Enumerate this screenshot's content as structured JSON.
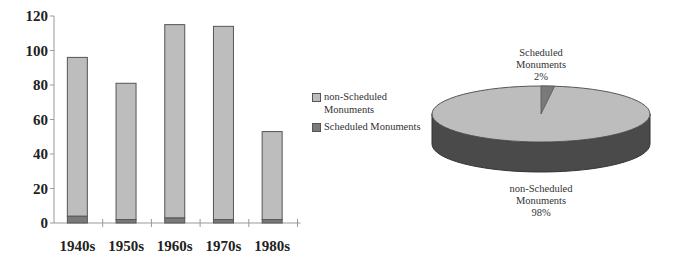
{
  "chart_data": [
    {
      "type": "bar",
      "stacked": true,
      "title": "",
      "xlabel": "",
      "ylabel": "",
      "categories": [
        "1940s",
        "1950s",
        "1960s",
        "1970s",
        "1980s"
      ],
      "series": [
        {
          "name": "Scheduled Monuments",
          "values": [
            4,
            2,
            3,
            2,
            2
          ],
          "color": "#7a7a7a"
        },
        {
          "name": "non-Scheduled Monuments",
          "values": [
            92,
            79,
            112,
            112,
            51
          ],
          "color": "#bdbdbd"
        }
      ],
      "totals": [
        96,
        81,
        115,
        114,
        53
      ],
      "ylim": [
        0,
        120
      ],
      "yticks": [
        0,
        20,
        40,
        60,
        80,
        100,
        120
      ],
      "grid": false,
      "legend_position": "right"
    },
    {
      "type": "pie",
      "style": "3d",
      "title": "",
      "slices": [
        {
          "label": "Scheduled Monuments",
          "value": 2,
          "display": "2%",
          "color": "#7a7a7a"
        },
        {
          "label": "non-Scheduled Monuments",
          "value": 98,
          "display": "98%",
          "color": "#bdbdbd"
        }
      ]
    }
  ],
  "legend": {
    "items": [
      {
        "label_line1": "non-Scheduled",
        "label_line2": "Monuments",
        "color": "#bdbdbd"
      },
      {
        "label_line1": "Scheduled Monuments",
        "label_line2": "",
        "color": "#7a7a7a"
      }
    ]
  },
  "pie_labels": {
    "scheduled": {
      "line1": "Scheduled",
      "line2": "Monuments",
      "line3": "2%"
    },
    "non_scheduled": {
      "line1": "non-Scheduled",
      "line2": "Monuments",
      "line3": "98%"
    }
  }
}
